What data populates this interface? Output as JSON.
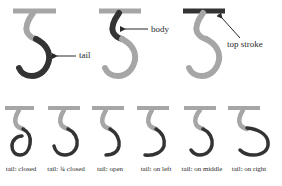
{
  "colors": {
    "highlight": "#333333",
    "muted": "#a6a6a6",
    "arrow": "#2a2a2a",
    "background": "#ffffff"
  },
  "top_row": {
    "glyphs": [
      {
        "highlighted_part": "tail",
        "label": "tail"
      },
      {
        "highlighted_part": "body",
        "label": "body"
      },
      {
        "highlighted_part": "top stroke",
        "label": "top stroke"
      }
    ]
  },
  "bottom_row": {
    "glyphs": [
      {
        "variant": "closed",
        "label": "tail: closed"
      },
      {
        "variant": "three-quarter-closed",
        "label": "tail: ¾ closed"
      },
      {
        "variant": "open",
        "label": "tail: open"
      },
      {
        "variant": "on-left",
        "label": "tail: on left"
      },
      {
        "variant": "on-middle",
        "label": "tail: on middle"
      },
      {
        "variant": "on-right",
        "label": "tail: on right"
      }
    ]
  }
}
